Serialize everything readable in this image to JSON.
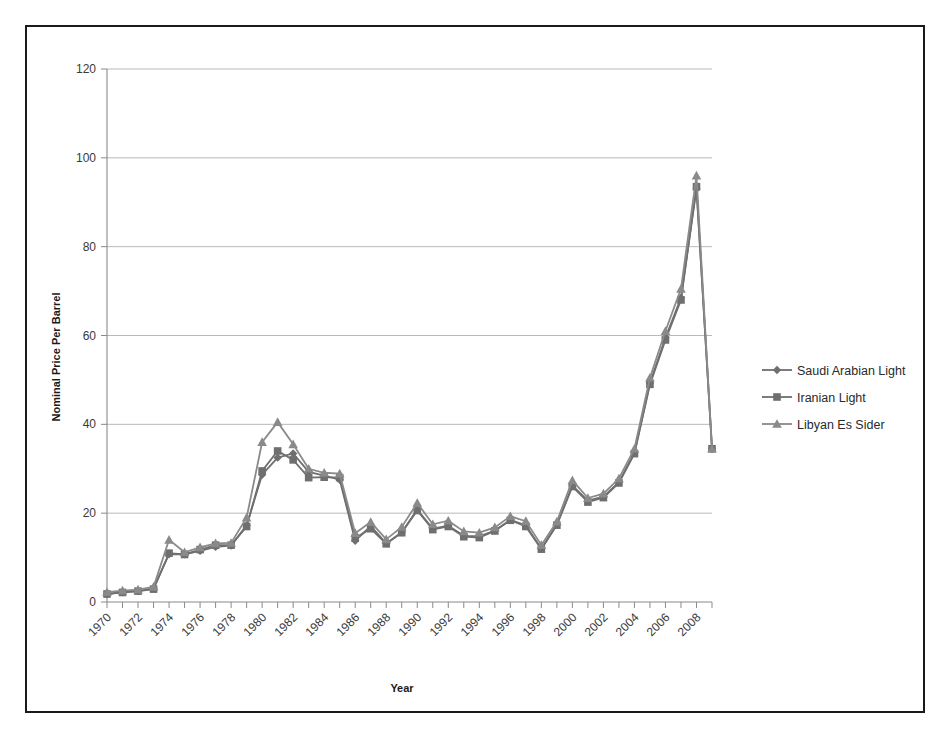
{
  "figure": {
    "frame_color": "#1a1a1a",
    "background": "#ffffff"
  },
  "chart_data": {
    "type": "line",
    "title": "",
    "xlabel": "Year",
    "ylabel": "Nominal Price Per Barrel",
    "ylim": [
      0,
      120
    ],
    "yticks": [
      0,
      20,
      40,
      60,
      80,
      100,
      120
    ],
    "grid": true,
    "legend_position": "right",
    "x": [
      1970,
      1971,
      1972,
      1973,
      1974,
      1975,
      1976,
      1977,
      1978,
      1979,
      1980,
      1981,
      1982,
      1983,
      1984,
      1985,
      1986,
      1987,
      1988,
      1989,
      1990,
      1991,
      1992,
      1993,
      1994,
      1995,
      1996,
      1997,
      1998,
      1999,
      2000,
      2001,
      2002,
      2003,
      2004,
      2005,
      2006,
      2007,
      2008,
      2009
    ],
    "xtick_labels": [
      "1970",
      "1972",
      "1974",
      "1976",
      "1978",
      "1980",
      "1982",
      "1984",
      "1986",
      "1988",
      "1990",
      "1992",
      "1994",
      "1996",
      "1998",
      "2000",
      "2002",
      "2004",
      "2006",
      "2008"
    ],
    "xtick_rotation": 45,
    "series": [
      {
        "name": "Saudi Arabian Light",
        "marker": "diamond",
        "color": "#6f6f6f",
        "values": [
          1.8,
          2.2,
          2.45,
          3.05,
          10.75,
          10.75,
          11.51,
          12.4,
          12.7,
          17.25,
          28.65,
          32.5,
          33.45,
          29.3,
          28.47,
          27.53,
          13.8,
          17.1,
          13.2,
          15.7,
          20.8,
          16.5,
          17.2,
          14.9,
          14.8,
          16.1,
          18.5,
          17.2,
          12.0,
          17.5,
          26.2,
          22.8,
          23.7,
          27.0,
          33.6,
          49.3,
          59.5,
          68.5,
          93.0,
          34.5
        ]
      },
      {
        "name": "Iranian Light",
        "marker": "square",
        "color": "#6f6f6f",
        "values": [
          1.8,
          2.15,
          2.45,
          2.9,
          11.0,
          10.7,
          11.8,
          12.8,
          12.8,
          17.0,
          29.5,
          34.0,
          32.0,
          28.0,
          28.1,
          28.0,
          14.4,
          16.5,
          13.1,
          15.6,
          20.6,
          16.3,
          17.0,
          14.7,
          14.5,
          16.0,
          18.4,
          17.0,
          11.9,
          17.3,
          26.0,
          22.5,
          23.5,
          26.8,
          33.4,
          49.0,
          59.0,
          68.0,
          93.5,
          34.5
        ]
      },
      {
        "name": "Libyan Es Sider",
        "marker": "triangle",
        "color": "#8a8a8a",
        "values": [
          2.2,
          2.55,
          2.8,
          3.4,
          14.0,
          11.2,
          12.3,
          13.2,
          13.3,
          19.0,
          36.0,
          40.5,
          35.5,
          30.0,
          29.1,
          28.9,
          15.5,
          18.0,
          14.1,
          16.9,
          22.3,
          17.5,
          18.3,
          15.9,
          15.6,
          16.8,
          19.3,
          18.2,
          12.8,
          18.1,
          27.4,
          23.4,
          24.4,
          27.8,
          34.5,
          50.5,
          61.0,
          70.5,
          96.0,
          34.5
        ]
      }
    ]
  },
  "series_display": [
    {
      "label": "Saudi Arabian Light",
      "marker": "diamond"
    },
    {
      "label": "Iranian Light",
      "marker": "square"
    },
    {
      "label": "Libyan Es Sider",
      "marker": "triangle"
    }
  ]
}
